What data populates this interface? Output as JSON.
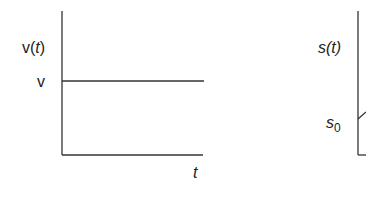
{
  "left_plot": {
    "y_axis_label_prefix": "v(",
    "y_axis_label_var": "t",
    "y_axis_label_suffix": ")",
    "level_label": "v",
    "x_axis_label": "t"
  },
  "right_plot": {
    "y_axis_label_prefix": "s(",
    "y_axis_label_var": "t",
    "y_axis_label_suffix": ")",
    "initial_label_base": "s",
    "initial_label_sub": "0"
  },
  "colors": {
    "line": "#333333",
    "text": "#222222"
  }
}
